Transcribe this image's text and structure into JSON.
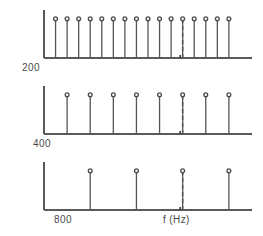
{
  "figure": {
    "width": 263,
    "height": 236,
    "background": "#ffffff",
    "line_color": "#555555",
    "marker_fill": "#ffffff",
    "dashed_color": "#6a6a6a"
  },
  "labels": {
    "panel1_label": "200",
    "panel2_label": "400",
    "panel3_label": "800",
    "xaxis_label": "f  (Hz)"
  },
  "chart_data": [
    {
      "type": "stem",
      "title": "",
      "subtitle": "Harmonic spectrum of a 200 Hz fundamental",
      "xlabel": "",
      "ylabel": "",
      "fundamental_hz": 200,
      "categories": [
        "200",
        "400",
        "600",
        "800",
        "1000",
        "1200",
        "1400",
        "1600",
        "1800",
        "2000",
        "2200",
        "2400",
        "2600",
        "2800",
        "3000",
        "3200"
      ],
      "x": [
        200,
        400,
        600,
        800,
        1000,
        1200,
        1400,
        1600,
        1800,
        2000,
        2200,
        2400,
        2600,
        2800,
        3000,
        3200
      ],
      "values": [
        1,
        1,
        1,
        1,
        1,
        1,
        1,
        1,
        1,
        1,
        1,
        1,
        1,
        1,
        1,
        1
      ],
      "xlim": [
        0,
        3600
      ],
      "ylim": [
        0,
        1.15
      ],
      "grid": false,
      "legend": "none",
      "annotations": [
        {
          "kind": "vertical-dashed-line",
          "x": 2400,
          "label": ""
        },
        {
          "kind": "axis-tick",
          "x": 2400,
          "label": ""
        }
      ]
    },
    {
      "type": "stem",
      "title": "",
      "subtitle": "Harmonic spectrum of a 400 Hz fundamental",
      "xlabel": "",
      "ylabel": "",
      "fundamental_hz": 400,
      "categories": [
        "400",
        "800",
        "1200",
        "1600",
        "2000",
        "2400",
        "2800",
        "3200"
      ],
      "x": [
        400,
        800,
        1200,
        1600,
        2000,
        2400,
        2800,
        3200
      ],
      "values": [
        1,
        1,
        1,
        1,
        1,
        1,
        1,
        1
      ],
      "xlim": [
        0,
        3600
      ],
      "ylim": [
        0,
        1.15
      ],
      "grid": false,
      "legend": "none",
      "annotations": [
        {
          "kind": "vertical-dashed-line",
          "x": 2400,
          "label": ""
        },
        {
          "kind": "axis-tick",
          "x": 2400,
          "label": ""
        }
      ]
    },
    {
      "type": "stem",
      "title": "",
      "subtitle": "Harmonic spectrum of an 800 Hz fundamental",
      "xlabel": "f  (Hz)",
      "ylabel": "",
      "fundamental_hz": 800,
      "categories": [
        "800",
        "1600",
        "2400",
        "3200"
      ],
      "x": [
        800,
        1600,
        2400,
        3200
      ],
      "values": [
        1,
        1,
        1,
        1
      ],
      "xlim": [
        0,
        3600
      ],
      "ylim": [
        0,
        1.15
      ],
      "grid": false,
      "legend": "none",
      "annotations": [
        {
          "kind": "vertical-dashed-line",
          "x": 2400,
          "label": ""
        },
        {
          "kind": "axis-tick",
          "x": 2400,
          "label": ""
        }
      ]
    }
  ]
}
